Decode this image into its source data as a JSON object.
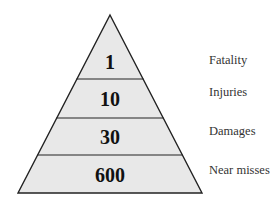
{
  "diagram": {
    "type": "pyramid",
    "fill_color": "#e8e8e8",
    "stroke_color": "#222222",
    "levels": [
      {
        "value": "1",
        "label": "Fatality"
      },
      {
        "value": "10",
        "label": "Injuries"
      },
      {
        "value": "30",
        "label": "Damages"
      },
      {
        "value": "600",
        "label": "Near misses"
      }
    ]
  }
}
